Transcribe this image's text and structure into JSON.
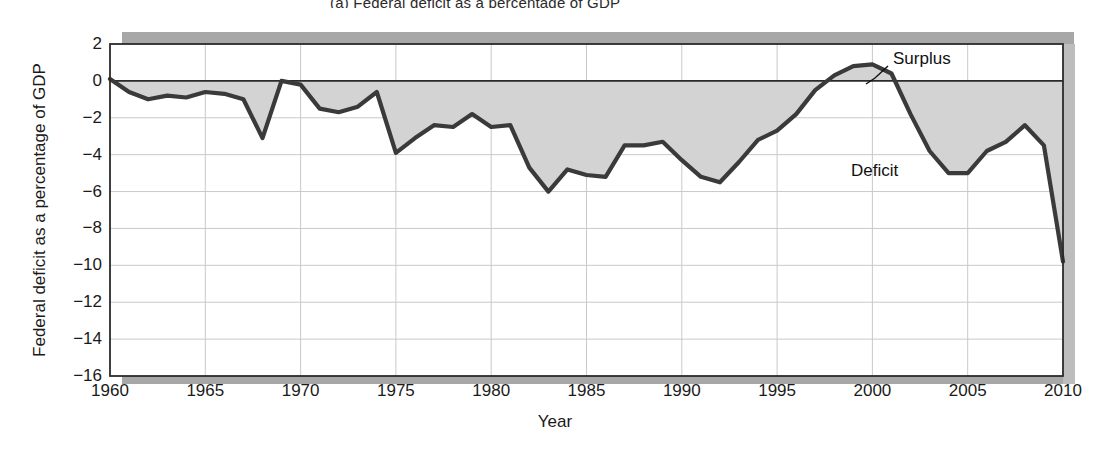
{
  "figure": {
    "title_fragment": "(a) Federal deficit as a percentage of GDP",
    "xlabel": "Year",
    "ylabel": "Federal deficit as a percentage of GDP",
    "annotations": {
      "surplus": "Surplus",
      "deficit": "Deficit"
    }
  },
  "chart_data": {
    "type": "area",
    "title": "",
    "xlabel": "Year",
    "ylabel": "Federal deficit as a percentage of GDP",
    "xlim": [
      1960,
      2010
    ],
    "ylim": [
      -16,
      2
    ],
    "xticks": [
      1960,
      1965,
      1970,
      1975,
      1980,
      1985,
      1990,
      1995,
      2000,
      2005,
      2010
    ],
    "yticks": [
      2,
      0,
      -2,
      -4,
      -6,
      -8,
      -10,
      -12,
      -14,
      -16
    ],
    "ytick_labels": [
      "2",
      "0",
      "−2",
      "−4",
      "−6",
      "−8",
      "−10",
      "−12",
      "−14",
      "−16"
    ],
    "grid": "horizontal-and-vertical",
    "legend": "none",
    "baseline": 0,
    "fill_color": "#d3d3d3",
    "line_color": "#3a3a3a",
    "annotations": [
      {
        "label": "Surplus",
        "x": 2000,
        "y": 0.9
      },
      {
        "label": "Deficit",
        "x": 2003,
        "y": -5.0
      }
    ],
    "x": [
      1960,
      1961,
      1962,
      1963,
      1964,
      1965,
      1966,
      1967,
      1968,
      1969,
      1970,
      1971,
      1972,
      1973,
      1974,
      1975,
      1976,
      1977,
      1978,
      1979,
      1980,
      1981,
      1982,
      1983,
      1984,
      1985,
      1986,
      1987,
      1988,
      1989,
      1990,
      1991,
      1992,
      1993,
      1994,
      1995,
      1996,
      1997,
      1998,
      1999,
      2000,
      2001,
      2002,
      2003,
      2004,
      2005,
      2006,
      2007,
      2008,
      2009,
      2010
    ],
    "y": [
      0.1,
      -0.6,
      -1.0,
      -0.8,
      -0.9,
      -0.6,
      -0.7,
      -1.0,
      -3.1,
      0.0,
      -0.2,
      -1.5,
      -1.7,
      -1.4,
      -0.6,
      -3.9,
      -3.1,
      -2.4,
      -2.5,
      -1.8,
      -2.5,
      -2.4,
      -4.7,
      -6.0,
      -4.8,
      -5.1,
      -5.2,
      -3.5,
      -3.5,
      -3.3,
      -4.3,
      -5.2,
      -5.5,
      -4.4,
      -3.2,
      -2.7,
      -1.8,
      -0.5,
      0.3,
      0.8,
      0.9,
      0.4,
      -1.8,
      -3.8,
      -5.0,
      -5.0,
      -3.8,
      -3.3,
      -2.4,
      -3.5,
      -9.8,
      -9.2
    ]
  }
}
